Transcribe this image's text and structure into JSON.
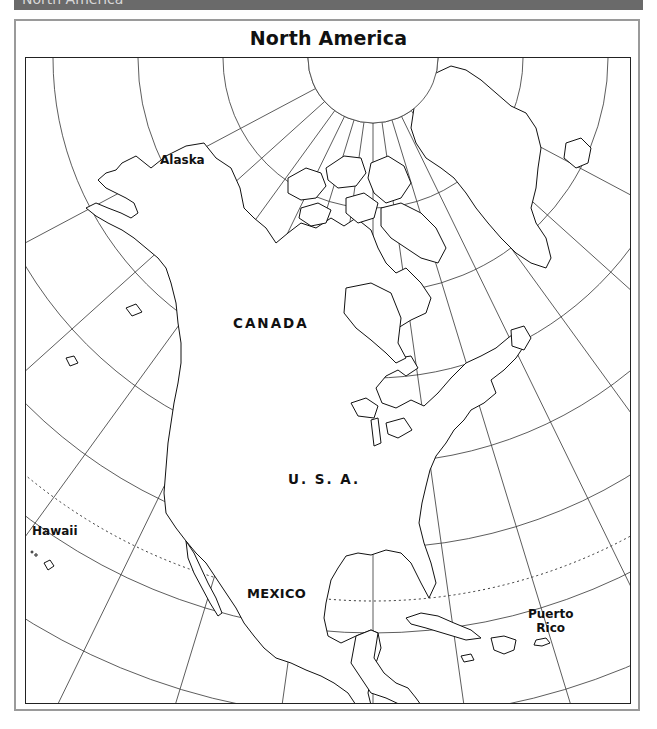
{
  "banner": {
    "text": "North America"
  },
  "map": {
    "title": "North America",
    "labels": {
      "alaska": "Alaska",
      "canada": "CANADA",
      "usa": "U. S. A.",
      "hawaii": "Hawaii",
      "mexico": "MEXICO",
      "puerto_rico_line1": "Puerto",
      "puerto_rico_line2": "Rico"
    },
    "projection": {
      "type": "conic",
      "pole_px": [
        347,
        0
      ],
      "parallel_radii_px": [
        65,
        150,
        235,
        320,
        405,
        490,
        575,
        660
      ],
      "tropic_of_cancer_radius_px": 543,
      "meridian_angles_deg": [
        -62,
        -48,
        -36,
        -26,
        -17,
        -8,
        0,
        8,
        17,
        26,
        36,
        48,
        62
      ]
    },
    "colors": {
      "banner": "#6a6a6a",
      "frame": "#9a9a9a",
      "line": "#222222",
      "background": "#ffffff"
    }
  }
}
